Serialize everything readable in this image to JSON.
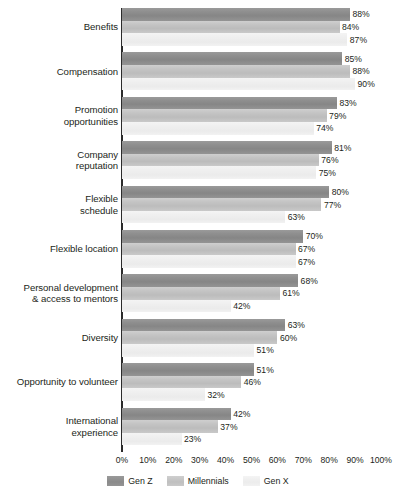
{
  "chart_data": {
    "type": "bar",
    "orientation": "horizontal",
    "title": "",
    "xlabel": "",
    "ylabel": "",
    "xlim": [
      0,
      100
    ],
    "grid": false,
    "legend_position": "bottom-center",
    "value_label_suffix": "%",
    "categories": [
      "Benefits",
      "Compensation",
      "Promotion opportunities",
      "Company reputation",
      "Flexible schedule",
      "Flexible location",
      "Personal development & access to mentors",
      "Diversity",
      "Opportunity to volunteer",
      "International experience"
    ],
    "category_lines": [
      [
        "Benefits"
      ],
      [
        "Compensation"
      ],
      [
        "Promotion",
        "opportunities"
      ],
      [
        "Company",
        "reputation"
      ],
      [
        "Flexible",
        "schedule"
      ],
      [
        "Flexible location"
      ],
      [
        "Personal development",
        "& access to mentors"
      ],
      [
        "Diversity"
      ],
      [
        "Opportunity to volunteer"
      ],
      [
        "International",
        "experience"
      ]
    ],
    "series": [
      {
        "name": "Gen Z",
        "color": "#8f8f8f",
        "values": [
          88,
          85,
          83,
          81,
          80,
          70,
          68,
          63,
          51,
          42
        ],
        "labels": [
          "88%",
          "85%",
          "83%",
          "81%",
          "80%",
          "70%",
          "68%",
          "63%",
          "51%",
          "42%"
        ]
      },
      {
        "name": "Millennials",
        "color": "#c4c4c4",
        "values": [
          84,
          88,
          79,
          76,
          77,
          67,
          61,
          60,
          46,
          37
        ],
        "labels": [
          "84%",
          "88%",
          "79%",
          "76%",
          "77%",
          "67%",
          "61%",
          "60%",
          "46%",
          "37%"
        ]
      },
      {
        "name": "Gen X",
        "color": "#efefef",
        "values": [
          87,
          90,
          74,
          75,
          63,
          67,
          42,
          51,
          32,
          23
        ],
        "labels": [
          "87%",
          "90%",
          "74%",
          "75%",
          "63%",
          "67%",
          "42%",
          "51%",
          "32%",
          "23%"
        ]
      }
    ],
    "x_ticks": [
      {
        "value": 0,
        "label": "0%"
      },
      {
        "value": 10,
        "label": "10%"
      },
      {
        "value": 20,
        "label": "20%"
      },
      {
        "value": 30,
        "label": "30%"
      },
      {
        "value": 40,
        "label": "40%"
      },
      {
        "value": 50,
        "label": "50%"
      },
      {
        "value": 60,
        "label": "60%"
      },
      {
        "value": 70,
        "label": "70%"
      },
      {
        "value": 80,
        "label": "80%"
      },
      {
        "value": 90,
        "label": "90%"
      },
      {
        "value": 100,
        "label": "100%"
      }
    ]
  },
  "legend": {
    "items": [
      {
        "label": "Gen Z",
        "color": "#8f8f8f"
      },
      {
        "label": "Millennials",
        "color": "#c4c4c4"
      },
      {
        "label": "Gen X",
        "color": "#efefef"
      }
    ]
  },
  "layout": {
    "axis_x_px": 122,
    "axis_top_px": 8,
    "plot_width_px": 259,
    "group_pitch_px": 44.4,
    "bar_height_px": 12.6
  }
}
